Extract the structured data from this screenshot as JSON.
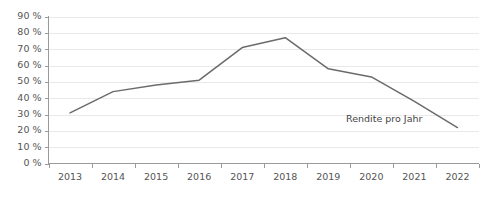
{
  "chart_data": {
    "type": "line",
    "title": "",
    "subtitle": "",
    "xlabel": "",
    "ylabel": "",
    "categories": [
      "2013",
      "2014",
      "2015",
      "2016",
      "2017",
      "2018",
      "2019",
      "2020",
      "2021",
      "2022"
    ],
    "series": [
      {
        "name": "Rendite pro Jahr",
        "color": "#6b6b6b",
        "values": [
          31,
          44,
          48,
          51,
          71,
          77,
          58,
          53,
          38,
          22
        ]
      }
    ],
    "legend": {
      "position": "inline-right",
      "entries": [
        "Rendite pro Jahr"
      ]
    },
    "annotations": [
      {
        "text": "Rendite pro Jahr",
        "x": "2021",
        "y": 27
      }
    ],
    "yaxis": {
      "ylim": [
        0,
        90
      ],
      "tick_values": [
        0,
        10,
        20,
        30,
        40,
        50,
        60,
        70,
        80,
        90
      ],
      "tick_labels": [
        "0 %",
        "10 %",
        "20 %",
        "30 %",
        "40 %",
        "50 %",
        "60 %",
        "70 %",
        "80 %",
        "90 %"
      ],
      "unit": "%"
    },
    "xaxis": {
      "tick_labels": [
        "2013",
        "2014",
        "2015",
        "2016",
        "2017",
        "2018",
        "2019",
        "2020",
        "2021",
        "2022"
      ]
    },
    "grid": {
      "horizontal": true,
      "vertical": false,
      "color": "#e9e9e9"
    },
    "colors": {
      "line": "#6b6b6b",
      "axis": "#9a9a9a",
      "grid": "#e9e9e9",
      "tick_text": "#555555",
      "annotation_text": "#444444",
      "background": "#ffffff"
    }
  }
}
